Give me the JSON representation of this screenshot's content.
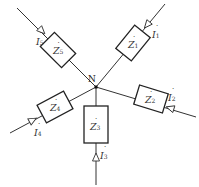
{
  "node": {
    "label": "N"
  },
  "branches": [
    {
      "impedance": "Z",
      "impedance_sub": "1",
      "current": "I",
      "current_sub": "1"
    },
    {
      "impedance": "Z",
      "impedance_sub": "2",
      "current": "I",
      "current_sub": "2"
    },
    {
      "impedance": "Z",
      "impedance_sub": "3",
      "current": "I",
      "current_sub": "3"
    },
    {
      "impedance": "Z",
      "impedance_sub": "4",
      "current": "I",
      "current_sub": "4"
    },
    {
      "impedance": "Z",
      "impedance_sub": "5",
      "current": "I",
      "current_sub": "5"
    }
  ],
  "colors": {
    "line": "#333333",
    "background": "#ffffff"
  }
}
